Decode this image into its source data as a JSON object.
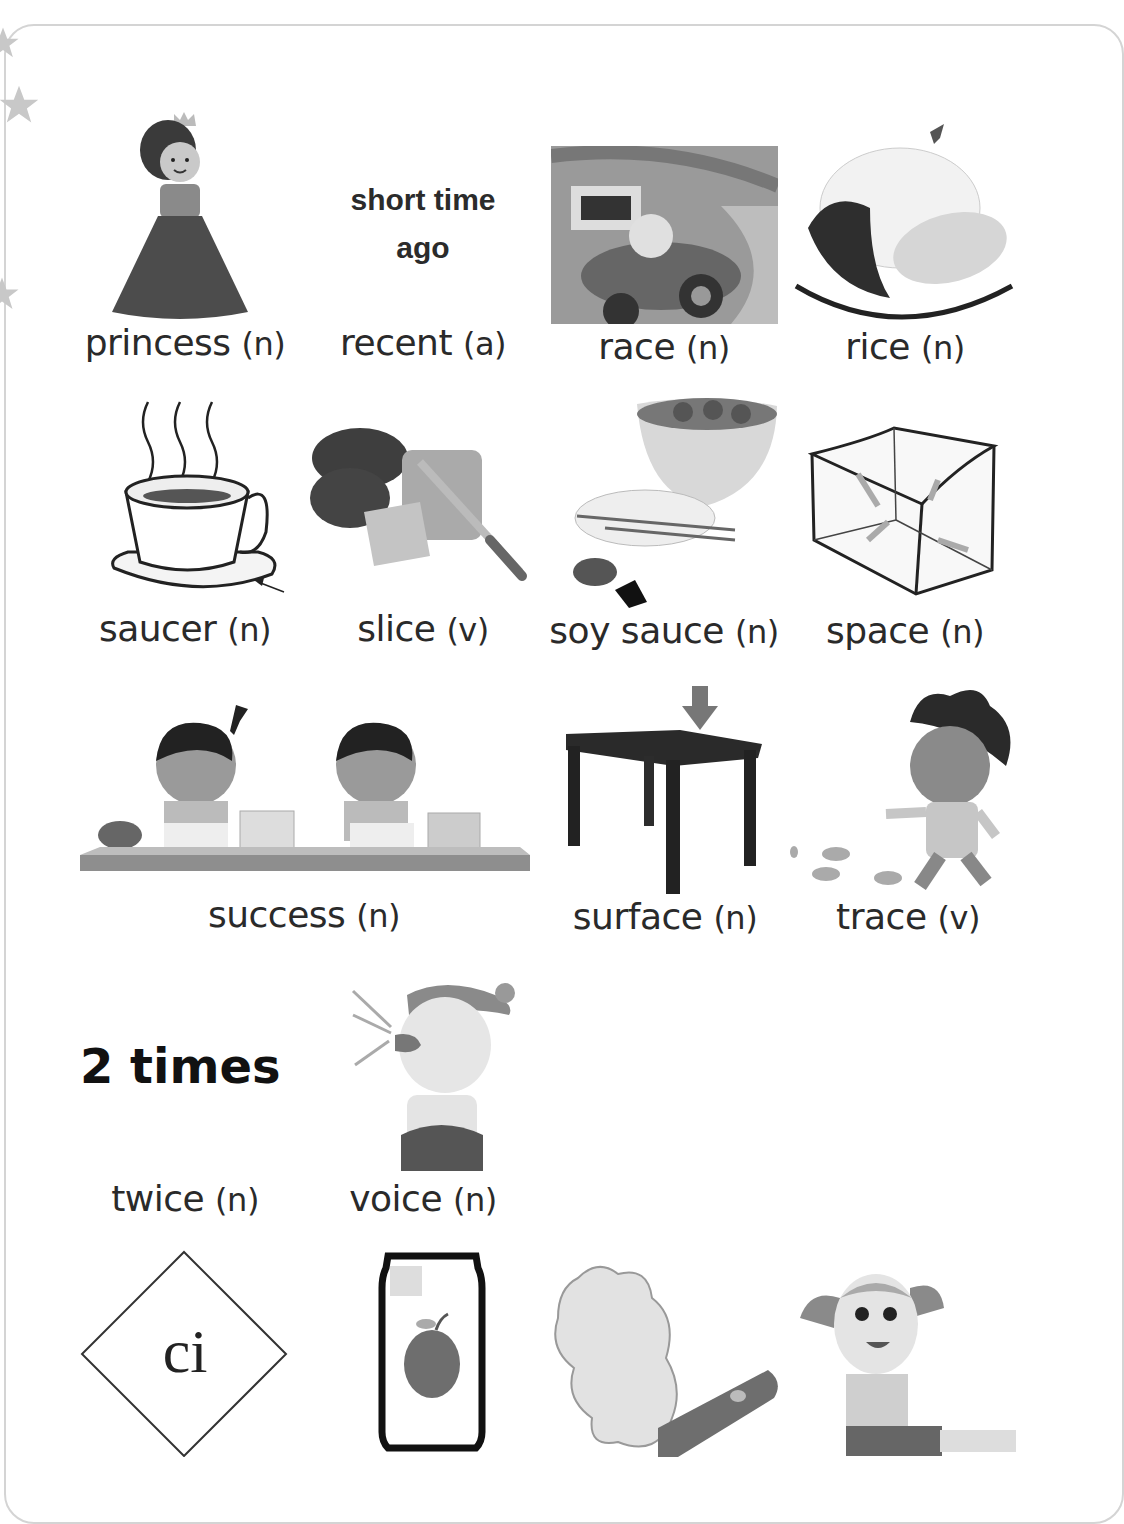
{
  "page": {
    "accent_gray": "#d4d4d4",
    "ink": "#2a2a2a"
  },
  "vocabulary": [
    {
      "word": "princess",
      "pos": "(n)",
      "illustration": "princess-in-gown"
    },
    {
      "word": "recent",
      "pos": "(a)",
      "definition_text": "short time ago"
    },
    {
      "word": "race",
      "pos": "(n)",
      "illustration": "boy-racing-car"
    },
    {
      "word": "rice",
      "pos": "(n)",
      "illustration": "plate-of-curry-rice"
    },
    {
      "word": "saucer",
      "pos": "(n)",
      "illustration": "cup-on-saucer-with-arrow"
    },
    {
      "word": "slice",
      "pos": "(v)",
      "illustration": "knife-slicing-bread"
    },
    {
      "word": "soy sauce",
      "pos": "(n)",
      "illustration": "dumplings-with-soy-sauce-dish"
    },
    {
      "word": "space",
      "pos": "(n)",
      "illustration": "empty-box-with-arrows"
    },
    {
      "word": "success",
      "pos": "(n)",
      "illustration": "two-kids-baking-cookies"
    },
    {
      "word": "surface",
      "pos": "(n)",
      "illustration": "table-with-arrow-on-top"
    },
    {
      "word": "trace",
      "pos": "(v)",
      "illustration": "boy-leaving-footprints"
    },
    {
      "word": "twice",
      "pos": "(n)",
      "definition_text": "2 times"
    },
    {
      "word": "voice",
      "pos": "(n)",
      "illustration": "girl-shouting"
    }
  ],
  "bottom_row": [
    {
      "illustration": "diamond-with-letters",
      "text": "ci"
    },
    {
      "illustration": "soda-can-with-apple"
    },
    {
      "illustration": "cannon-smoke-cloud"
    },
    {
      "illustration": "girl-sitting"
    }
  ]
}
